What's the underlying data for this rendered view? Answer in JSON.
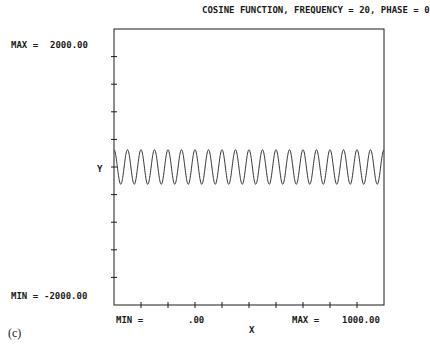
{
  "chart_data": {
    "type": "line",
    "title": "COSINE FUNCTION, FREQUENCY = 20, PHASE = 0",
    "xlabel": "X",
    "ylabel": "Y",
    "xlim": [
      0,
      1000
    ],
    "ylim": [
      -2000,
      2000
    ],
    "function": "y = A*cos(2*pi*20*x/1000 + 0)",
    "frequency": 20,
    "phase": 0,
    "amplitude_estimate": 250,
    "x_ticks_count": 9,
    "y_ticks_count": 9,
    "grid": false,
    "legend": null,
    "series": [
      {
        "name": "cosine",
        "description": "20 full cycles across x range, oscillating about y=0 with amplitude ~250"
      }
    ]
  },
  "labels": {
    "title": "COSINE FUNCTION, FREQUENCY = 20, PHASE = 0",
    "y_max_label": "MAX =",
    "y_max_value": "2000.00",
    "y_min_label": "MIN =",
    "y_min_value": "-2000.00",
    "y_axis_label": "Y",
    "x_min_label": "MIN =",
    "x_min_value": ".00",
    "x_max_label": "MAX =",
    "x_max_value": "1000.00",
    "x_axis_label": "X",
    "figure_caption": "(c)"
  },
  "colors": {
    "ink": "#1a1a1a",
    "background": "#ffffff"
  }
}
